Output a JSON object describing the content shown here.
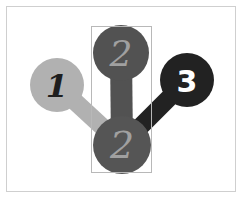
{
  "diagram": {
    "nodes": [
      {
        "id": "node-1",
        "label": "1",
        "fill": "#b1b1b1",
        "text_color": "#1e1e1e",
        "cx": 57,
        "cy": 85,
        "r": 27
      },
      {
        "id": "node-2-top",
        "label": "2",
        "fill": "#525252",
        "text_color": "#a0a0a0",
        "cx": 121,
        "cy": 53,
        "r": 28
      },
      {
        "id": "node-3",
        "label": "3",
        "fill": "#222222",
        "text_color": "#ffffff",
        "cx": 187,
        "cy": 80,
        "r": 27
      },
      {
        "id": "node-2-bottom",
        "label": "2",
        "fill": "#555555",
        "text_color": "#a0a0a0",
        "cx": 122,
        "cy": 145,
        "r": 29
      }
    ],
    "selection_box": {
      "x": 91,
      "y": 26,
      "width": 60,
      "height": 146,
      "stroke": "#b8b8b8"
    }
  }
}
